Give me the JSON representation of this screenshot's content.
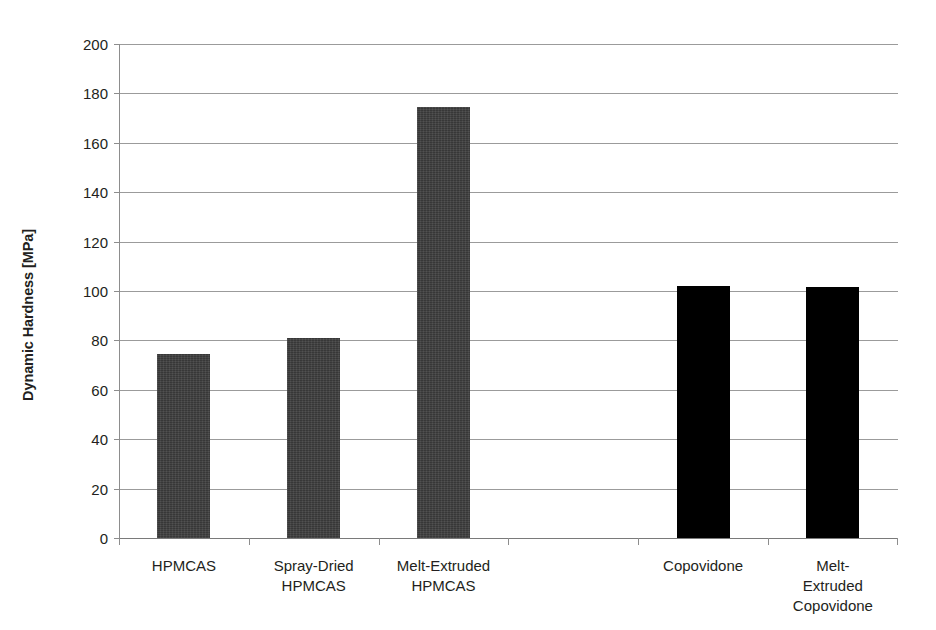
{
  "chart_data": {
    "type": "bar",
    "title": "",
    "subtitle": "",
    "xlabel": "",
    "ylabel": "Dynamic Hardness [MPa]",
    "categories": [
      "HPMCAS",
      "Spray-Dried\nHPMCAS",
      "Melt-Extruded\nHPMCAS",
      "Copovidone",
      "Melt-Extruded\nCopovidone"
    ],
    "values": [
      74.5,
      81,
      174.5,
      102,
      101.5
    ],
    "bar_colors": [
      "#3d3d3d",
      "#3d3d3d",
      "#3d3d3d",
      "#000000",
      "#000000"
    ],
    "ylim": [
      0,
      200
    ],
    "ytick_values": [
      0,
      20,
      40,
      60,
      80,
      100,
      120,
      140,
      160,
      180,
      200
    ],
    "ytick_labels": [
      "0",
      "20",
      "40",
      "60",
      "80",
      "100",
      "120",
      "140",
      "160",
      "180",
      "200"
    ],
    "grid": true,
    "grid_axis": "y",
    "legend": false,
    "legend_position": "none",
    "gap_after_index": 2,
    "accent_color": "#3d3d3d",
    "grid_color": "#9b9b9b",
    "text_color": "#231f20"
  }
}
